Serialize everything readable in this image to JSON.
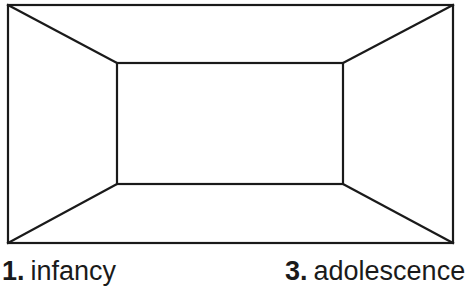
{
  "diagram": {
    "type": "one-point perspective room (box)",
    "stroke_color": "#1a1a1a",
    "background": "#ffffff",
    "outer_rect": {
      "x1": 8,
      "y1": 5,
      "x2": 453,
      "y2": 243
    },
    "inner_rect": {
      "x1": 117,
      "y1": 63,
      "x2": 343,
      "y2": 184
    }
  },
  "labels": [
    {
      "number": "1.",
      "text": "infancy"
    },
    {
      "number": "3.",
      "text": "adolescence"
    }
  ]
}
